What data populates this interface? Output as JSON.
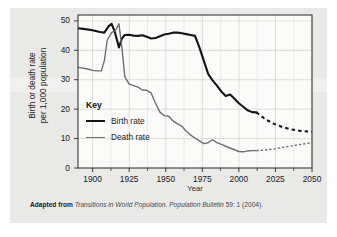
{
  "figure": {
    "background_color": "#e9e9e7",
    "caption": {
      "lead": "Adapted from",
      "work": "Transitions in World Population.",
      "publication": "Population Bulletin",
      "volume_issue_year": "59: 1 (2004)."
    }
  },
  "chart_data": {
    "type": "line",
    "title": "",
    "xlabel": "Year",
    "ylabel": "Birth or death rate per 1,000 population",
    "ylabel_lines": [
      "Birth or death rate",
      "per 1,000 population"
    ],
    "xlim": [
      1890,
      2050
    ],
    "ylim": [
      0,
      52
    ],
    "xticks": [
      1900,
      1925,
      1950,
      1975,
      2000,
      2025,
      2050
    ],
    "yticks": [
      0,
      10,
      20,
      30,
      40,
      50
    ],
    "grid": true,
    "legend_title": "Key",
    "legend_position": "inside-left",
    "series": [
      {
        "name": "Birth rate",
        "color": "#151515",
        "width": 2.1,
        "x": [
          1890,
          1895,
          1900,
          1905,
          1908,
          1911,
          1913,
          1915,
          1918,
          1920,
          1922,
          1925,
          1928,
          1931,
          1934,
          1937,
          1940,
          1943,
          1946,
          1949,
          1952,
          1955,
          1958,
          1961,
          1964,
          1967,
          1970,
          1973,
          1976,
          1979,
          1982,
          1985,
          1988,
          1991,
          1994,
          1997,
          2000,
          2003,
          2006,
          2009,
          2012
        ],
        "y": [
          47.5,
          47.2,
          46.8,
          46.2,
          46.0,
          48.2,
          49.0,
          46.5,
          41.0,
          44.0,
          45.2,
          45.3,
          45.0,
          44.9,
          45.1,
          44.6,
          44.0,
          44.2,
          44.8,
          45.4,
          45.6,
          46.0,
          46.0,
          45.8,
          45.5,
          45.2,
          44.9,
          41.0,
          36.5,
          32.0,
          29.8,
          28.0,
          26.0,
          24.5,
          25.0,
          23.5,
          22.0,
          20.8,
          19.6,
          19.0,
          18.9
        ],
        "projection_x": [
          2012,
          2018,
          2024,
          2030,
          2036,
          2042,
          2050
        ],
        "projection_y": [
          18.9,
          16.6,
          15.0,
          13.9,
          13.1,
          12.6,
          12.3
        ],
        "projection_style": "dashed"
      },
      {
        "name": "Death rate",
        "color": "#6e6e6e",
        "width": 1.4,
        "x": [
          1890,
          1895,
          1900,
          1903,
          1906,
          1908,
          1910,
          1913,
          1916,
          1918,
          1920,
          1922,
          1925,
          1928,
          1931,
          1934,
          1937,
          1940,
          1943,
          1946,
          1949,
          1952,
          1955,
          1958,
          1961,
          1964,
          1967,
          1970,
          1973,
          1976,
          1979,
          1982,
          1985,
          1988,
          1991,
          1994,
          1997,
          2000,
          2003,
          2006,
          2009,
          2012
        ],
        "y": [
          34.2,
          33.8,
          33.2,
          33.0,
          33.0,
          36.5,
          43.5,
          46.0,
          47.0,
          49.0,
          41.0,
          31.0,
          28.5,
          28.0,
          27.5,
          26.5,
          26.4,
          25.5,
          22.0,
          19.0,
          17.8,
          17.6,
          16.0,
          15.0,
          14.2,
          12.5,
          11.2,
          10.2,
          9.2,
          8.3,
          8.6,
          9.6,
          8.6,
          8.0,
          7.4,
          6.8,
          6.2,
          5.6,
          5.5,
          5.8,
          5.9,
          5.9
        ],
        "projection_x": [
          2012,
          2018,
          2024,
          2030,
          2036,
          2042,
          2050
        ],
        "projection_y": [
          5.9,
          6.1,
          6.5,
          7.0,
          7.5,
          8.0,
          8.6
        ],
        "projection_style": "dashed"
      }
    ]
  }
}
